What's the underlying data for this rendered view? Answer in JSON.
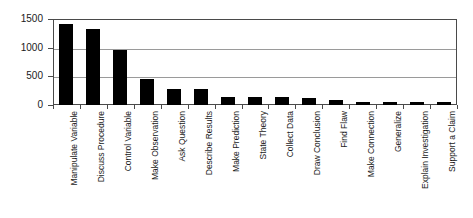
{
  "chart_data": {
    "type": "bar",
    "title": "",
    "subtitle": "",
    "xlabel": "",
    "ylabel": "",
    "ylim": [
      0,
      1500
    ],
    "yticks": [
      0,
      500,
      1000,
      1500
    ],
    "ytick_labels": [
      "0",
      "500",
      "1000",
      "1500"
    ],
    "grid": true,
    "legend": null,
    "bar_color": "#000000",
    "axis_color": "#4a4a4a",
    "grid_color": "#9a9a9a",
    "background": "#ffffff",
    "categories": [
      "Manipulate Variable",
      "Discuss Procedure",
      "Control Variable",
      "Make Observation",
      "Ask Question",
      "Describe Results",
      "Make Prediction",
      "State Theory",
      "Collect Data",
      "Draw Conclusion",
      "Find Flaw",
      "Make Connection",
      "Generalize",
      "Explain Investigation",
      "Support a Claim"
    ],
    "values": [
      1420,
      1320,
      955,
      450,
      280,
      275,
      145,
      135,
      140,
      130,
      90,
      55,
      55,
      55,
      50
    ]
  }
}
